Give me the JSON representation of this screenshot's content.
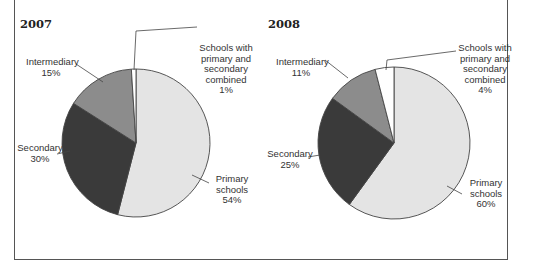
{
  "chart_data": [
    {
      "type": "pie",
      "title": "2007",
      "categories": [
        "Primary schools",
        "Secondary",
        "Intermediary",
        "Schools with primary and secondary combined"
      ],
      "values": [
        54,
        30,
        15,
        1
      ],
      "unit": "%",
      "labels": [
        "Primary schools 54%",
        "Secondary 30%",
        "Intermediary 15%",
        "Schools with primary and secondary combined 1%"
      ],
      "colors": [
        "#e4e4e4",
        "#3a3a3a",
        "#8c8c8c",
        "#ffffff"
      ]
    },
    {
      "type": "pie",
      "title": "2008",
      "categories": [
        "Primary schools",
        "Secondary",
        "Intermediary",
        "Schools with primary and secondary combined"
      ],
      "values": [
        60,
        25,
        11,
        4
      ],
      "unit": "%",
      "labels": [
        "Primary schools 60%",
        "Secondary 25%",
        "Intermediary 11%",
        "Schools with primary and secondary combined 4%"
      ],
      "colors": [
        "#e4e4e4",
        "#3a3a3a",
        "#8c8c8c",
        "#ffffff"
      ]
    }
  ],
  "charts": [
    {
      "title": "2007",
      "labels": {
        "combined": [
          "Schools with",
          "primary and",
          "secondary",
          "combined",
          "1%"
        ],
        "intermediary": [
          "Intermediary",
          "15%"
        ],
        "secondary": [
          "Secondary",
          "30%"
        ],
        "primary": [
          "Primary",
          "schools",
          "54%"
        ]
      }
    },
    {
      "title": "2008",
      "labels": {
        "combined": [
          "Schools with",
          "primary and",
          "secondary",
          "combined",
          "4%"
        ],
        "intermediary": [
          "Intermediary",
          "11%"
        ],
        "secondary": [
          "Secondary",
          "25%"
        ],
        "primary": [
          "Primary",
          "schools",
          "60%"
        ]
      }
    }
  ]
}
